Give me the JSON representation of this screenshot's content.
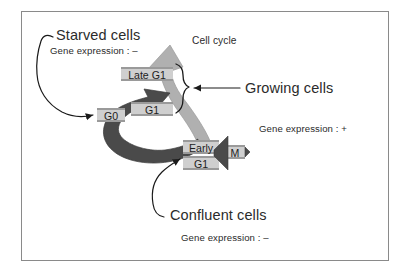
{
  "figure": {
    "title_label": "Cell cycle",
    "border_color": "#8a8a8a",
    "background": "#ffffff"
  },
  "phases": [
    {
      "id": "late-g1",
      "label": "Late G1",
      "fill": "#cfcfcf"
    },
    {
      "id": "g1",
      "label": "G1",
      "fill": "#cfcfcf"
    },
    {
      "id": "g0",
      "label": "G0",
      "fill": "#cfcfcf"
    },
    {
      "id": "early-g1-line1",
      "label": "Early",
      "fill": "#cfcfcf"
    },
    {
      "id": "early-g1-line2",
      "label": "G1",
      "fill": "#cfcfcf"
    },
    {
      "id": "m",
      "label": "M",
      "fill": "#cfcfcf"
    }
  ],
  "annotations": {
    "starved": {
      "title": "Starved cells",
      "expression": "Gene expression : –"
    },
    "growing": {
      "title": "Growing cells",
      "expression": "Gene expression : +"
    },
    "confluent": {
      "title": "Confluent cells",
      "expression": "Gene expression : –"
    }
  },
  "arrows": {
    "cycle_light_fill": "#b0b0b0",
    "cycle_dark_fill": "#4a4a4a",
    "m_wedge_fill": "#4a4a4a",
    "pointer_stroke": "#1a1a1a",
    "brace_stroke": "#1a1a1a"
  },
  "icons": {
    "starved_pointer": "curved-arrow-icon",
    "confluent_pointer": "curved-arrow-icon",
    "growing_pointer": "straight-arrow-icon",
    "growing_brace": "curly-brace-icon",
    "cycle_progress": "thick-arrow-icon",
    "restriction_arrow": "thick-arrow-icon",
    "mitosis_wedge": "wedge-arrow-icon"
  }
}
